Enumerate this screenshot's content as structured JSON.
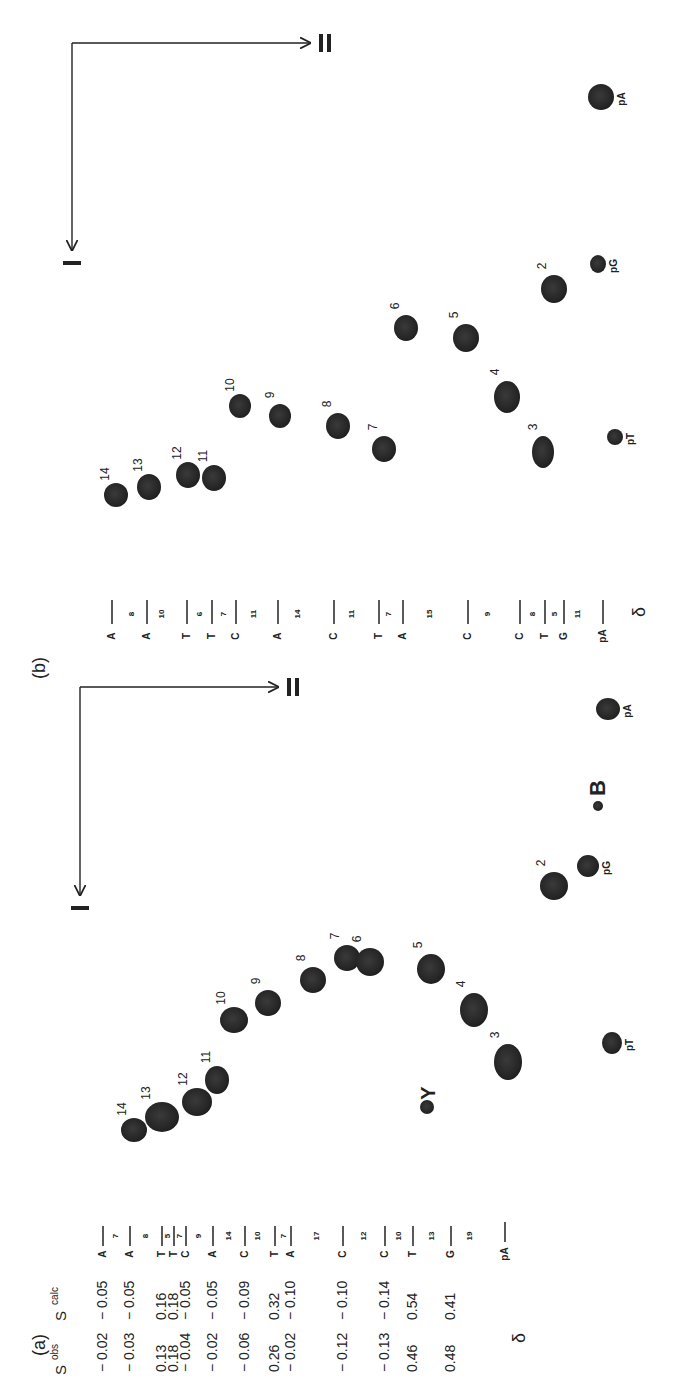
{
  "figure": {
    "rotation_deg": -90,
    "ink_color": "#1e1e1e",
    "spot_color": "#262626",
    "background": "#ffffff"
  },
  "panel_a": {
    "label": "(a)",
    "axis": {
      "origin": [
        80,
        687
      ],
      "axis_I": {
        "label": "I",
        "end": [
          80,
          895
        ]
      },
      "axis_II": {
        "label": "II",
        "end": [
          278,
          687
        ]
      }
    },
    "table": {
      "header_obs": "S",
      "header_obs_sup": "obs",
      "header_calc": "S",
      "header_calc_sup": "calc",
      "rows": [
        {
          "s_obs": "− 0.02",
          "s_calc": "− 0.05",
          "nuc": "A",
          "y": 1337
        },
        {
          "s_obs": "− 0.03",
          "s_calc": "− 0.05",
          "nuc": "A",
          "y": 1317
        },
        {
          "s_obs": "0.13",
          "s_calc": "0.16",
          "nuc": "T",
          "y": 1288
        },
        {
          "s_obs": "0.18",
          "s_calc": "0.18",
          "nuc": "T",
          "y": 1276
        },
        {
          "s_obs": "− 0.04",
          "s_calc": "− 0.05",
          "nuc": "C",
          "y": 1263
        },
        {
          "s_obs": "− 0.02",
          "s_calc": "− 0.05",
          "nuc": "A",
          "y": 1236
        },
        {
          "s_obs": "− 0.06",
          "s_calc": "− 0.09",
          "nuc": "C",
          "y": 1203
        },
        {
          "s_obs": "0.26",
          "s_calc": "0.32",
          "nuc": "T",
          "y": 1176
        },
        {
          "s_obs": "− 0.02",
          "s_calc": "− 0.10",
          "nuc": "A",
          "y": 1158
        },
        {
          "s_obs": "− 0.12",
          "s_calc": "− 0.10",
          "nuc": "C",
          "y": 1102
        },
        {
          "s_obs": "− 0.13",
          "s_calc": "− 0.14",
          "nuc": "C",
          "y": 1060
        },
        {
          "s_obs": "0.46",
          "s_calc": "0.54",
          "nuc": "T",
          "y": 1030
        },
        {
          "s_obs": "0.48",
          "s_calc": "0.41",
          "nuc": "G",
          "y": 990
        }
      ],
      "ladder_numbers": [
        {
          "text": "7",
          "y": 1327
        },
        {
          "text": "8",
          "y": 1302
        },
        {
          "text": "5",
          "y": 1282
        },
        {
          "text": "7",
          "y": 1270
        },
        {
          "text": "9",
          "y": 1250
        },
        {
          "text": "14",
          "y": 1220
        },
        {
          "text": "10",
          "y": 1190
        },
        {
          "text": "7",
          "y": 1167
        },
        {
          "text": "17",
          "y": 1132
        },
        {
          "text": "12",
          "y": 1082
        },
        {
          "text": "10",
          "y": 1045
        },
        {
          "text": "13",
          "y": 1010
        },
        {
          "text": "19",
          "y": 968
        }
      ],
      "terminal": {
        "text": "pA",
        "y": 950
      },
      "delta": {
        "text": "δ",
        "y": 905
      }
    },
    "spots": [
      {
        "label": "14",
        "x": 134,
        "y": 1130,
        "rx": 13,
        "ry": 12
      },
      {
        "label": "13",
        "x": 162,
        "y": 1117,
        "rx": 17,
        "ry": 15
      },
      {
        "label": "12",
        "x": 197,
        "y": 1102,
        "rx": 15,
        "ry": 14
      },
      {
        "label": "11",
        "x": 217,
        "y": 1080,
        "rx": 12,
        "ry": 14
      },
      {
        "label": "10",
        "x": 234,
        "y": 1020,
        "rx": 14,
        "ry": 13
      },
      {
        "label": "9",
        "x": 268,
        "y": 1003,
        "rx": 13,
        "ry": 13
      },
      {
        "label": "8",
        "x": 313,
        "y": 980,
        "rx": 13,
        "ry": 13
      },
      {
        "label": "7",
        "x": 347,
        "y": 958,
        "rx": 13,
        "ry": 13
      },
      {
        "label": "6",
        "x": 370,
        "y": 962,
        "rx": 14,
        "ry": 14
      },
      {
        "label": "5",
        "x": 431,
        "y": 969,
        "rx": 14,
        "ry": 15
      },
      {
        "label": "4",
        "x": 474,
        "y": 1010,
        "rx": 14,
        "ry": 17
      },
      {
        "label": "3",
        "x": 508,
        "y": 1062,
        "rx": 14,
        "ry": 18
      },
      {
        "label": "2",
        "x": 554,
        "y": 886,
        "rx": 14,
        "ry": 14
      },
      {
        "label": "pG",
        "x": 588,
        "y": 866,
        "rx": 11,
        "ry": 11
      },
      {
        "label": "pT",
        "x": 612,
        "y": 1043,
        "rx": 10,
        "ry": 11
      },
      {
        "label": "Y",
        "x": 427,
        "y": 1107,
        "rx": 7,
        "ry": 7
      },
      {
        "label": "B",
        "x": 598,
        "y": 806,
        "rx": 5,
        "ry": 5
      },
      {
        "label": "pA",
        "x": 608,
        "y": 709,
        "rx": 12,
        "ry": 11
      }
    ]
  },
  "panel_b": {
    "label": "(b)",
    "axis": {
      "origin": [
        72,
        43
      ],
      "axis_I": {
        "label": "I",
        "end": [
          72,
          250
        ]
      },
      "axis_II": {
        "label": "II",
        "end": [
          310,
          43
        ]
      }
    },
    "ladder": {
      "entries": [
        {
          "nuc": "A",
          "y": 614
        },
        {
          "num": "8",
          "y": 601
        },
        {
          "nuc": "A",
          "y": 588
        },
        {
          "num": "10",
          "y": 575
        },
        {
          "nuc": "T",
          "y": 561
        },
        {
          "num": "6",
          "y": 551
        },
        {
          "nuc": "T",
          "y": 541
        },
        {
          "num": "7",
          "y": 531
        },
        {
          "nuc": "C",
          "y": 521
        },
        {
          "num": "11",
          "y": 508
        },
        {
          "nuc": "A",
          "y": 494
        },
        {
          "num": "14",
          "y": 478
        },
        {
          "nuc": "C",
          "y": 462
        },
        {
          "num": "11",
          "y": 446
        },
        {
          "nuc": "T",
          "y": 432
        },
        {
          "num": "7",
          "y": 423
        },
        {
          "nuc": "A",
          "y": 413
        },
        {
          "num": "15",
          "y": 395
        },
        {
          "nuc": "C",
          "y": 374
        },
        {
          "num": "9",
          "y": 356
        },
        {
          "nuc": "C",
          "y": 335
        },
        {
          "num": "8",
          "y": 322
        },
        {
          "nuc": "T",
          "y": 311
        },
        {
          "num": "5",
          "y": 302
        },
        {
          "nuc": "G",
          "y": 291
        },
        {
          "num": "11",
          "y": 278
        },
        {
          "nuc": "pA",
          "y": 262
        }
      ],
      "delta": {
        "text": "δ",
        "y": 218
      }
    },
    "spots": [
      {
        "label": "14",
        "x": 116,
        "y": 495,
        "rx": 12,
        "ry": 12
      },
      {
        "label": "13",
        "x": 149,
        "y": 487,
        "rx": 12,
        "ry": 13
      },
      {
        "label": "12",
        "x": 188,
        "y": 475,
        "rx": 12,
        "ry": 13
      },
      {
        "label": "11",
        "x": 214,
        "y": 478,
        "rx": 12,
        "ry": 13
      },
      {
        "label": "10",
        "x": 240,
        "y": 406,
        "rx": 11,
        "ry": 12
      },
      {
        "label": "9",
        "x": 280,
        "y": 416,
        "rx": 11,
        "ry": 12
      },
      {
        "label": "8",
        "x": 338,
        "y": 426,
        "rx": 12,
        "ry": 13
      },
      {
        "label": "7",
        "x": 384,
        "y": 449,
        "rx": 12,
        "ry": 13
      },
      {
        "label": "6",
        "x": 406,
        "y": 328,
        "rx": 12,
        "ry": 13
      },
      {
        "label": "5",
        "x": 466,
        "y": 338,
        "rx": 13,
        "ry": 14
      },
      {
        "label": "4",
        "x": 507,
        "y": 397,
        "rx": 13,
        "ry": 16
      },
      {
        "label": "3",
        "x": 543,
        "y": 452,
        "rx": 11,
        "ry": 16
      },
      {
        "label": "2",
        "x": 554,
        "y": 289,
        "rx": 13,
        "ry": 14
      },
      {
        "label": "pG",
        "x": 598,
        "y": 264,
        "rx": 8,
        "ry": 9
      },
      {
        "label": "pT",
        "x": 615,
        "y": 437,
        "rx": 8,
        "ry": 8
      },
      {
        "label": "pA",
        "x": 601,
        "y": 97,
        "rx": 13,
        "ry": 13
      }
    ]
  }
}
